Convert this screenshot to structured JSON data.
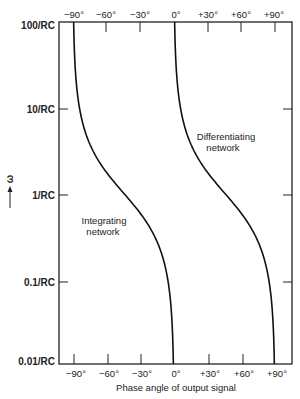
{
  "chart_data": {
    "type": "line",
    "title": "",
    "xlabel": "Phase angle of output signal",
    "ylabel": "ω",
    "ylabel_arrow": "up",
    "x_ticks": [
      "−90°",
      "−60°",
      "−30°",
      "0°",
      "+30°",
      "+60°",
      "+90°"
    ],
    "x_tick_values": [
      -90,
      -60,
      -30,
      0,
      30,
      60,
      90
    ],
    "y_ticks": [
      "100/RC",
      "10/RC",
      "1/RC",
      "0.1/RC",
      "0.01/RC"
    ],
    "y_tick_values": [
      100,
      10,
      1,
      0.1,
      0.01
    ],
    "y_scale": "log",
    "xlim": [
      -90,
      90
    ],
    "ylim": [
      0.01,
      100
    ],
    "grid": false,
    "legend": "none",
    "series": [
      {
        "name": "Integrating network",
        "formula": "phase = -arctan(ωRC)",
        "x": [
          -0.6,
          -5.7,
          -45,
          -84.3,
          -89.4
        ],
        "y": [
          0.01,
          0.1,
          1,
          10,
          100
        ]
      },
      {
        "name": "Differentiating network",
        "formula": "phase = 90° - arctan(ωRC)",
        "x": [
          89.4,
          84.3,
          45,
          5.7,
          0.6
        ],
        "y": [
          0.01,
          0.1,
          1,
          10,
          100
        ]
      }
    ],
    "annotations": [
      {
        "text": "Integrating",
        "text2": "network"
      },
      {
        "text": "Differentiating",
        "text2": "network"
      }
    ]
  },
  "labels": {
    "top_ticks": [
      "−90°",
      "−60°",
      "−30°",
      "0°",
      "+30°",
      "+60°",
      "+90°"
    ],
    "bottom_ticks": [
      "−90°",
      "−60°",
      "−30°",
      "0°",
      "+30°",
      "+60°",
      "+90°"
    ],
    "y_ticks": [
      "100/RC",
      "10/RC",
      "1/RC",
      "0.1/RC",
      "0.01/RC"
    ],
    "omega": "ω",
    "xlabel": "Phase angle of output signal",
    "integrating_line1": "Integrating",
    "integrating_line2": "network",
    "differentiating_line1": "Differentiating",
    "differentiating_line2": "network"
  }
}
